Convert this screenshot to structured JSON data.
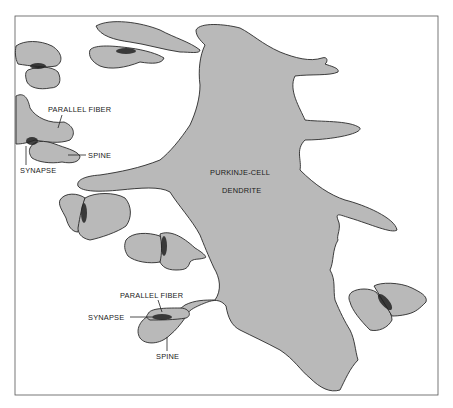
{
  "diagram": {
    "title": "",
    "colors": {
      "fill": "#b9b9b9",
      "stroke": "#2a2a2a",
      "background": "#ffffff",
      "synapse": "#222222"
    },
    "labels": {
      "dendrite_line1": "PURKINJE-CELL",
      "dendrite_line2": "DENDRITE",
      "upper_parallel_fiber": "PARALLEL FIBER",
      "upper_spine": "SPINE",
      "upper_synapse": "SYNAPSE",
      "lower_parallel_fiber": "PARALLEL FIBER",
      "lower_synapse": "SYNAPSE",
      "lower_spine": "SPINE"
    }
  }
}
